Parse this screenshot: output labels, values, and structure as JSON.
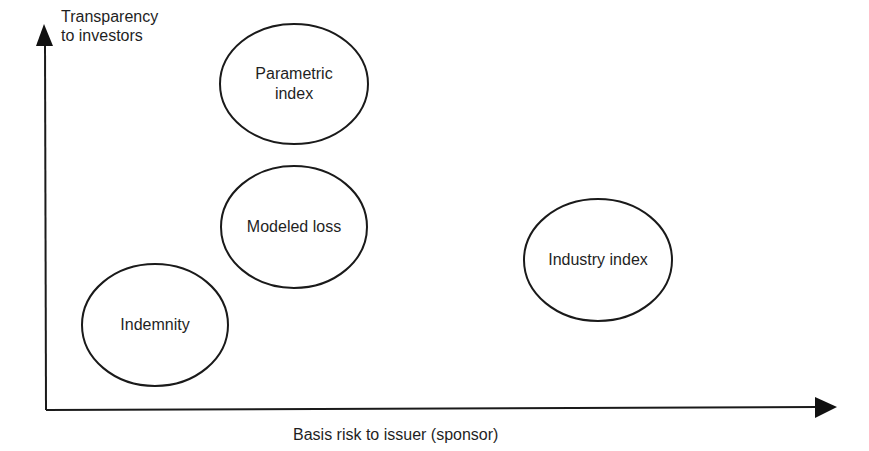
{
  "diagram": {
    "y_axis_label": [
      "Transparency",
      "to investors"
    ],
    "x_axis_label": "Basis risk to issuer (sponsor)",
    "colors": {
      "stroke": "#1a1a1a",
      "text": "#1f1f1f",
      "background": "#ffffff"
    },
    "bubbles": [
      {
        "id": "parametric",
        "lines": [
          "Parametric",
          "index"
        ],
        "cx": 294,
        "cy": 84,
        "rx": 74,
        "ry": 60
      },
      {
        "id": "modeled",
        "lines": [
          "Modeled loss"
        ],
        "cx": 294,
        "cy": 227,
        "rx": 73,
        "ry": 61
      },
      {
        "id": "indemnity",
        "lines": [
          "Indemnity"
        ],
        "cx": 155,
        "cy": 325,
        "rx": 73,
        "ry": 61
      },
      {
        "id": "industry",
        "lines": [
          "Industry index"
        ],
        "cx": 598,
        "cy": 260,
        "rx": 74,
        "ry": 61
      }
    ]
  }
}
